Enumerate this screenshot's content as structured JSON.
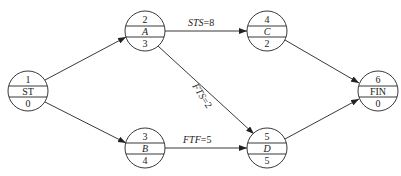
{
  "diagram": {
    "type": "precedence network (activity-on-node)",
    "nodes": [
      {
        "id": "ST",
        "top": "1",
        "name": "ST",
        "bottom": "0",
        "italic": false
      },
      {
        "id": "A",
        "top": "2",
        "name": "A",
        "bottom": "3",
        "italic": true
      },
      {
        "id": "B",
        "top": "3",
        "name": "B",
        "bottom": "4",
        "italic": true
      },
      {
        "id": "C",
        "top": "4",
        "name": "C",
        "bottom": "2",
        "italic": true
      },
      {
        "id": "D",
        "top": "5",
        "name": "D",
        "bottom": "5",
        "italic": true
      },
      {
        "id": "FIN",
        "top": "6",
        "name": "FIN",
        "bottom": "0",
        "italic": false
      }
    ],
    "edges": [
      {
        "from": "ST",
        "to": "A",
        "label": ""
      },
      {
        "from": "ST",
        "to": "B",
        "label": ""
      },
      {
        "from": "A",
        "to": "C",
        "label_type": "STS",
        "label_value": "=8"
      },
      {
        "from": "A",
        "to": "D",
        "label_type": "FTS",
        "label_value": "=2"
      },
      {
        "from": "B",
        "to": "D",
        "label_type": "FTF",
        "label_value": "=5"
      },
      {
        "from": "C",
        "to": "FIN",
        "label": ""
      },
      {
        "from": "D",
        "to": "FIN",
        "label": ""
      }
    ]
  }
}
